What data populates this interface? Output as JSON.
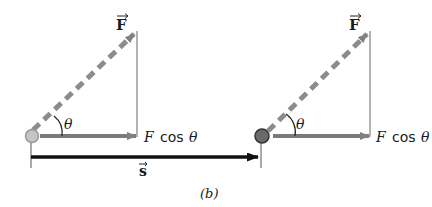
{
  "figure": {
    "caption": "(b)",
    "colors": {
      "force_vector": "#8c8c8c",
      "component_vector": "#7a7a7a",
      "displacement_vector": "#111111",
      "ball_start": "#bdbdbd",
      "ball_end": "#5a5a5a"
    },
    "left_diagram": {
      "force_label": "F",
      "angle_label": "θ",
      "component_label_f": "F",
      "component_label_cos": "cos",
      "component_label_theta": "θ"
    },
    "right_diagram": {
      "force_label": "F",
      "angle_label": "θ",
      "component_label_f": "F",
      "component_label_cos": "cos",
      "component_label_theta": "θ"
    },
    "displacement_label": "s"
  }
}
